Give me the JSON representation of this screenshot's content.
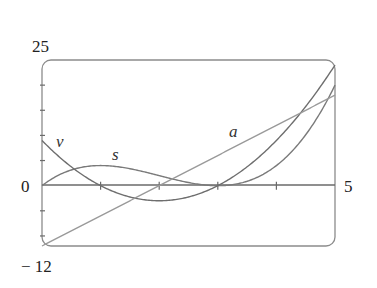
{
  "chart_data": {
    "type": "line",
    "title": "",
    "xlabel": "",
    "ylabel": "",
    "xlim": [
      0,
      5
    ],
    "ylim": [
      -12,
      25
    ],
    "grid": false,
    "legend": "none (inline labels)",
    "x_tick_labels": [
      {
        "value": 0,
        "label": "0"
      },
      {
        "value": 5,
        "label": "5"
      }
    ],
    "y_tick_labels": [
      {
        "value": 25,
        "label": "25"
      },
      {
        "value": -12,
        "label": "− 12"
      }
    ],
    "x_ticks": [
      1,
      2,
      3,
      4
    ],
    "y_ticks": [
      -10,
      -5,
      5,
      10,
      15,
      20
    ],
    "x": [
      0,
      0.5,
      1,
      1.5,
      2,
      2.5,
      3,
      3.5,
      4,
      4.5,
      5
    ],
    "series": [
      {
        "name": "s",
        "formula": "t^3 - 6t^2 + 9t",
        "values": [
          0,
          3.125,
          4,
          3.375,
          2,
          0.625,
          0,
          0.875,
          4,
          10.125,
          20
        ],
        "color": "#7a7a7a"
      },
      {
        "name": "v",
        "formula": "3t^2 - 12t + 9",
        "values": [
          9,
          3.75,
          0,
          -2.25,
          -3,
          -2.25,
          0,
          3.75,
          9,
          15.75,
          24
        ],
        "color": "#6e6e6e"
      },
      {
        "name": "a",
        "formula": "6t - 12",
        "values": [
          -12,
          -9,
          -6,
          -3,
          0,
          3,
          6,
          9,
          12,
          15,
          18
        ],
        "color": "#9a9a9a"
      }
    ],
    "annotations": [
      {
        "text": "v",
        "x": 0.3,
        "y": 9.5
      },
      {
        "text": "s",
        "x": 1.3,
        "y": 5.5
      },
      {
        "text": "a",
        "x": 3.25,
        "y": 10.5
      }
    ]
  },
  "labels": {
    "y_top": "25",
    "y_bottom": "− 12",
    "x_origin": "0",
    "x_end": "5",
    "curve_v": "v",
    "curve_s": "s",
    "curve_a": "a"
  },
  "colors": {
    "frame": "#8c8c8c",
    "axis": "#6a6a6a"
  }
}
